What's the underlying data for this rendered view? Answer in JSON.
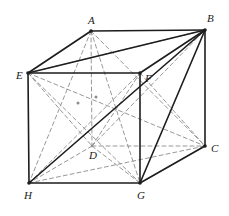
{
  "figure": {
    "type": "geometry-line-drawing",
    "width": 229,
    "height": 216,
    "background_color": "#ffffff",
    "solid_line_color": "#1d1d1d",
    "dashed_line_color": "#8c8c8c",
    "label_color": "#1a1a1a",
    "solid_stroke_width": 1.6,
    "dashed_stroke_width": 0.9,
    "dash_pattern": "4,3"
  },
  "vertices": [
    {
      "id": "A",
      "label": "A",
      "x": 91,
      "y": 31,
      "label_x": 88,
      "label_y": 24,
      "hidden": false
    },
    {
      "id": "B",
      "label": "B",
      "x": 205,
      "y": 30,
      "label_x": 207,
      "label_y": 22,
      "hidden": false
    },
    {
      "id": "C",
      "label": "C",
      "x": 205,
      "y": 146,
      "label_x": 211,
      "label_y": 152,
      "hidden": false
    },
    {
      "id": "D",
      "label": "D",
      "x": 92,
      "y": 146,
      "label_x": 89,
      "label_y": 159,
      "hidden": true
    },
    {
      "id": "E",
      "label": "E",
      "x": 28,
      "y": 73,
      "label_x": 16,
      "label_y": 79,
      "hidden": false
    },
    {
      "id": "F",
      "label": "F",
      "x": 140,
      "y": 73,
      "label_x": 145,
      "label_y": 82,
      "hidden": false
    },
    {
      "id": "G",
      "label": "G",
      "x": 140,
      "y": 183,
      "label_x": 137,
      "label_y": 199,
      "hidden": false
    },
    {
      "id": "H",
      "label": "H",
      "x": 29,
      "y": 183,
      "label_x": 24,
      "label_y": 199,
      "hidden": false
    }
  ],
  "interior_points": [
    {
      "id": "P1",
      "name": "face-center-EDGH",
      "x": 78,
      "y": 103
    },
    {
      "id": "P2",
      "name": "face-center-ABFE",
      "x": 96,
      "y": 97
    }
  ],
  "solid_edges": [
    {
      "from": "A",
      "to": "B",
      "name": "edge-AB"
    },
    {
      "from": "B",
      "to": "C",
      "name": "edge-BC"
    },
    {
      "from": "A",
      "to": "E",
      "name": "edge-AE"
    },
    {
      "from": "B",
      "to": "F",
      "name": "edge-BF"
    },
    {
      "from": "E",
      "to": "F",
      "name": "edge-EF"
    },
    {
      "from": "E",
      "to": "H",
      "name": "edge-EH"
    },
    {
      "from": "F",
      "to": "G",
      "name": "edge-FG"
    },
    {
      "from": "H",
      "to": "G",
      "name": "edge-HG"
    },
    {
      "from": "G",
      "to": "C",
      "name": "edge-GC"
    },
    {
      "from": "B",
      "to": "E",
      "name": "diagonal-BE"
    },
    {
      "from": "B",
      "to": "G",
      "name": "diagonal-BG"
    },
    {
      "from": "H",
      "to": "B",
      "name": "space-diagonal-HB"
    }
  ],
  "dashed_edges": [
    {
      "from": "A",
      "to": "D",
      "name": "edge-AD"
    },
    {
      "from": "D",
      "to": "C",
      "name": "edge-DC"
    },
    {
      "from": "D",
      "to": "H",
      "name": "edge-DH"
    },
    {
      "from": "A",
      "to": "H",
      "name": "diagonal-AH"
    },
    {
      "from": "E",
      "to": "D",
      "name": "diagonal-ED"
    },
    {
      "from": "A",
      "to": "G",
      "name": "diagonal-AG"
    },
    {
      "from": "D",
      "to": "G",
      "name": "diagonal-DG"
    },
    {
      "from": "D",
      "to": "B",
      "name": "diagonal-DB"
    },
    {
      "from": "H",
      "to": "C",
      "name": "diagonal-HC"
    },
    {
      "from": "E",
      "to": "C",
      "name": "diagonal-EC"
    },
    {
      "from": "E",
      "to": "G",
      "name": "diagonal-EG"
    },
    {
      "from": "G",
      "to": "C",
      "name": "diagonal-GC-dashed"
    },
    {
      "from": "H",
      "to": "F",
      "name": "diagonal-HF"
    },
    {
      "from": "A",
      "to": "C",
      "name": "space-diagonal-AC"
    },
    {
      "from": "D",
      "to": "F",
      "name": "space-diagonal-DF"
    },
    {
      "from": "E",
      "to": "B",
      "name": "diagonal-EB-dashed"
    },
    {
      "from": "F",
      "to": "C",
      "name": "edge-FC"
    }
  ]
}
